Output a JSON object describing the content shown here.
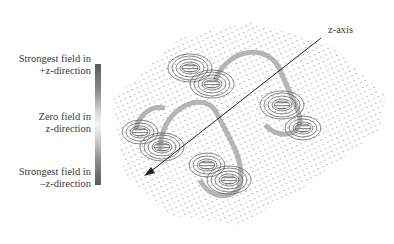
{
  "figure": {
    "type": "3D magnetic field vector plot",
    "legend": {
      "top_label": "Strongest field in +z-direction",
      "top_line1": "Strongest field in",
      "top_line2": "+z-direction",
      "mid_line1": "Zero field in",
      "mid_line2": "z-direction",
      "bot_line1": "Strongest field in",
      "bot_line2": "–z-direction",
      "colorbar": {
        "top_color": "#5a5a5a",
        "middle_color": "#f4f4f4",
        "bottom_color": "#5a5a5a"
      }
    },
    "axis": {
      "label": "z-axis",
      "arrow_color": "#222222"
    },
    "colors": {
      "vector_dots": "#b5b5b5",
      "contours": "#555555",
      "loop_band": "#a8a8a8"
    },
    "dipoles": [
      {
        "id": "upper-left-pair",
        "cx": 200,
        "cy": 75
      },
      {
        "id": "left-pair",
        "cx": 155,
        "cy": 140
      },
      {
        "id": "right-pair",
        "cx": 290,
        "cy": 110
      },
      {
        "id": "bottom-pair",
        "cx": 215,
        "cy": 175
      }
    ]
  }
}
